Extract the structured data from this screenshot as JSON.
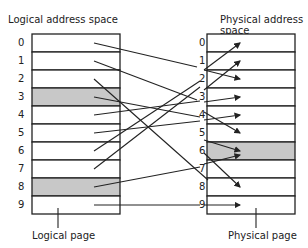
{
  "left": {
    "title": "Logical address space",
    "caption": "Logical page",
    "rows": [
      "0",
      "1",
      "2",
      "3",
      "4",
      "5",
      "6",
      "7",
      "8",
      "9"
    ],
    "shaded": [
      3,
      8
    ]
  },
  "right": {
    "title": "Physical address space",
    "caption": "Physical page",
    "rows": [
      "0",
      "1",
      "2",
      "3",
      "4",
      "5",
      "6",
      "7",
      "8",
      "9"
    ],
    "shaded": [
      6
    ]
  },
  "colors": {
    "line": "#222222",
    "shade": "#c8c8c8"
  }
}
